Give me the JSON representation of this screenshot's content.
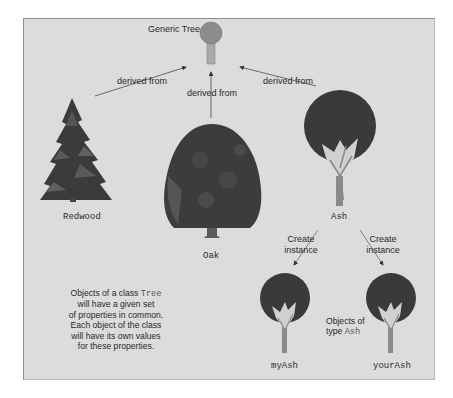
{
  "diagram": {
    "root": {
      "label": "Generic Tree"
    },
    "relations": {
      "derived_label": "derived from",
      "instance_label_line1": "Create",
      "instance_label_line2": "instance"
    },
    "classes": [
      {
        "name": "Redwood",
        "shape": "conifer"
      },
      {
        "name": "Oak",
        "shape": "broadleaf-dome"
      },
      {
        "name": "Ash",
        "shape": "round-crown"
      }
    ],
    "instances": [
      {
        "name": "myAsh",
        "type": "Ash"
      },
      {
        "name": "yourAsh",
        "type": "Ash"
      }
    ],
    "instances_caption": {
      "line1": "Objects of",
      "line2_prefix": "type ",
      "line2_code": "Ash"
    },
    "note": {
      "line1_prefix": "Objects of a class ",
      "line1_code": "Tree",
      "line2": "will have a given set",
      "line3": "of properties in common.",
      "line4": "Each object of the class",
      "line5": "will have its own values",
      "line6": "for these properties."
    },
    "colors": {
      "panel": "#dcdcdc",
      "foliage_dark": "#3a3a3a",
      "foliage_mid": "#555555",
      "trunk": "#8a8a8a",
      "generic_tree": "#8c8c8c",
      "arrow": "#4a4a4a"
    }
  }
}
